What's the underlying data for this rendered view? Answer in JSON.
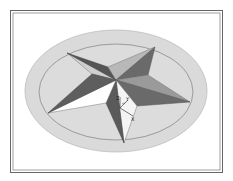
{
  "viewport": {
    "background": "#ffffff",
    "frame_color": "#555555"
  },
  "model": {
    "name": "star",
    "base_outer_fill": "#d9d9d9",
    "base_inner_fill": "#dcdcdc",
    "base_stroke": "#8a8a8a",
    "face_light": "#ffffff",
    "face_mid": "#b4b4b4",
    "face_dark": "#6a6a6a",
    "face_darker": "#555555"
  },
  "triad": {
    "x_label": "X",
    "y_label": "Y",
    "z_label": "Z"
  }
}
